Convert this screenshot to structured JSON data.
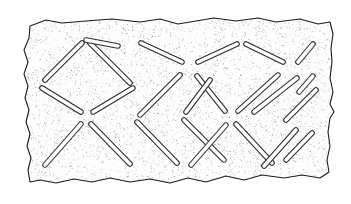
{
  "figure": {
    "type": "technical-line-drawing",
    "domain": "archaeological-illustration",
    "width": 351,
    "height": 204,
    "background_color": "#ffffff",
    "outline_color": "#1a1a1a",
    "stipple_color": "#8a8a8a",
    "groove_fill_color": "#ffffff",
    "groove_outline_color": "#2b2b2b",
    "body_fill_color": "#fdfdfd"
  },
  "sherd": {
    "name": "stippled-sherd-body",
    "outline_width": 1.1,
    "description": "Irregular torn-edge rectangular plaque with fine stipple shading",
    "outline_path": "M 30,26 L 46,20 L 62,23 L 86,21 L 112,19 L 140,22 L 160,19 L 178,24 L 196,21 L 214,18 L 236,21 L 258,18 L 276,22 L 300,19 L 318,24 L 330,22 L 333,34 L 331,48 L 332,62 L 330,78 L 333,92 L 330,104 L 334,112 L 330,118 L 328,132 L 330,146 L 327,160 L 329,172 L 320,178 L 302,175 L 284,178 L 262,175 L 244,180 L 226,176 L 206,182 L 188,178 L 170,183 L 150,179 L 130,182 L 110,178 L 92,182 L 74,179 L 56,183 L 40,180 L 30,182 L 28,170 L 31,158 L 27,146 L 30,134 L 26,122 L 29,110 L 25,98 L 28,86 L 24,74 L 28,62 L 24,50 L 29,38 Z",
    "stipple": {
      "name": "stipple-texture",
      "density": "fine",
      "dot_radius": 0.45,
      "seed": 20240517,
      "count": 5200
    }
  },
  "grooves": {
    "name": "incised-groove-set",
    "count": 24,
    "stroke_half_width": 2.3,
    "description": "Stadium-shaped incised lines forming diagonal lattice; four radiate from each crossing node",
    "nodes": [
      {
        "id": "node-a",
        "x": 86,
        "y": 117
      },
      {
        "id": "node-b",
        "x": 190,
        "y": 69
      },
      {
        "id": "node-c",
        "x": 231,
        "y": 117
      },
      {
        "id": "node-d",
        "x": 306,
        "y": 69
      }
    ],
    "items": [
      {
        "id": "g01",
        "x1": 45,
        "y1": 80,
        "x2": 82,
        "y2": 43,
        "dir": "ne"
      },
      {
        "id": "g02",
        "x1": 90,
        "y1": 43,
        "x2": 130,
        "y2": 83,
        "dir": "se"
      },
      {
        "id": "g03",
        "x1": 42,
        "y1": 88,
        "x2": 81,
        "y2": 112,
        "dir": "se"
      },
      {
        "id": "g04",
        "x1": 93,
        "y1": 112,
        "x2": 133,
        "y2": 88,
        "dir": "ne"
      },
      {
        "id": "g05",
        "x1": 45,
        "y1": 165,
        "x2": 81,
        "y2": 124,
        "dir": "ne"
      },
      {
        "id": "g06",
        "x1": 91,
        "y1": 124,
        "x2": 130,
        "y2": 164,
        "dir": "se"
      },
      {
        "id": "g07",
        "x1": 140,
        "y1": 115,
        "x2": 180,
        "y2": 75,
        "dir": "ne"
      },
      {
        "id": "g08",
        "x1": 141,
        "y1": 43,
        "x2": 182,
        "y2": 62,
        "dir": "se"
      },
      {
        "id": "g09",
        "x1": 137,
        "y1": 122,
        "x2": 177,
        "y2": 163,
        "dir": "se"
      },
      {
        "id": "g10",
        "x1": 198,
        "y1": 62,
        "x2": 237,
        "y2": 44,
        "dir": "ne"
      },
      {
        "id": "g11",
        "x1": 197,
        "y1": 76,
        "x2": 225,
        "y2": 111,
        "dir": "se"
      },
      {
        "id": "g12",
        "x1": 184,
        "y1": 120,
        "x2": 224,
        "y2": 160,
        "dir": "se"
      },
      {
        "id": "g13",
        "x1": 186,
        "y1": 112,
        "x2": 210,
        "y2": 80,
        "dir": "ne"
      },
      {
        "id": "g14",
        "x1": 238,
        "y1": 111,
        "x2": 278,
        "y2": 75,
        "dir": "ne"
      },
      {
        "id": "g15",
        "x1": 236,
        "y1": 124,
        "x2": 272,
        "y2": 163,
        "dir": "se"
      },
      {
        "id": "g16",
        "x1": 191,
        "y1": 165,
        "x2": 226,
        "y2": 125,
        "dir": "ne"
      },
      {
        "id": "g17",
        "x1": 246,
        "y1": 44,
        "x2": 283,
        "y2": 62,
        "dir": "se"
      },
      {
        "id": "g18",
        "x1": 254,
        "y1": 112,
        "x2": 297,
        "y2": 78,
        "dir": "ne"
      },
      {
        "id": "g19",
        "x1": 298,
        "y1": 62,
        "x2": 313,
        "y2": 44,
        "dir": "ne"
      },
      {
        "id": "g20",
        "x1": 313,
        "y1": 76,
        "x2": 299,
        "y2": 92,
        "dir": "se"
      },
      {
        "id": "g21",
        "x1": 286,
        "y1": 120,
        "x2": 316,
        "y2": 90,
        "dir": "ne"
      },
      {
        "id": "g22",
        "x1": 264,
        "y1": 166,
        "x2": 296,
        "y2": 130,
        "dir": "ne"
      },
      {
        "id": "g23",
        "x1": 286,
        "y1": 160,
        "x2": 312,
        "y2": 133,
        "dir": "ne"
      },
      {
        "id": "g24",
        "x1": 118,
        "y1": 46,
        "x2": 86,
        "y2": 40,
        "dir": "ne"
      }
    ]
  }
}
